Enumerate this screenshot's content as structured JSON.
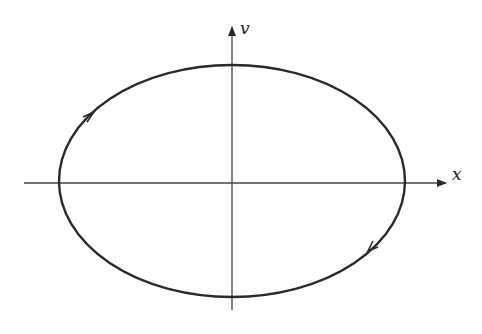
{
  "diagram": {
    "type": "phase-portrait",
    "axes": {
      "x_label": "x",
      "y_label": "v"
    },
    "curve": {
      "shape": "ellipse",
      "direction": "clockwise",
      "arrows": [
        "upper-left (pointing right/up)",
        "lower-right (pointing left/down)"
      ]
    },
    "colors": {
      "stroke": "#2a2a2a",
      "background": "#ffffff"
    }
  }
}
